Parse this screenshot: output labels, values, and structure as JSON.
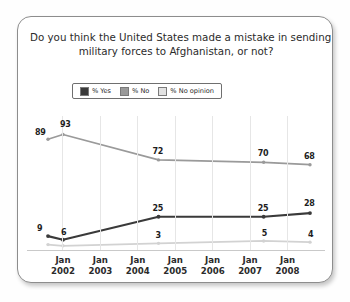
{
  "card": {
    "title_line1": "Do you think the United States made a mistake in sending",
    "title_line2": "military forces to Afghanistan, or not?"
  },
  "chart_data": {
    "type": "line",
    "title": "Do you think the United States made a mistake in sending military forces to Afghanistan, or not?",
    "xlabel": "",
    "ylabel": "",
    "ylim": [
      0,
      100
    ],
    "grid": "vertical",
    "legend_position": "top-center",
    "x_tick_labels": [
      {
        "month": "Jan",
        "year": "2002"
      },
      {
        "month": "Jan",
        "year": "2003"
      },
      {
        "month": "Jan",
        "year": "2004"
      },
      {
        "month": "Jan",
        "year": "2005"
      },
      {
        "month": "Jan",
        "year": "2006"
      },
      {
        "month": "Jan",
        "year": "2007"
      },
      {
        "month": "Jan",
        "year": "2008"
      }
    ],
    "series": [
      {
        "name": "% Yes",
        "color": "#3a3a3a",
        "points": [
          {
            "x": 0.0,
            "y": 9,
            "label": "9"
          },
          {
            "x": 0.42,
            "y": 6,
            "label": "6"
          },
          {
            "x": 3.1,
            "y": 25,
            "label": "25"
          },
          {
            "x": 6.05,
            "y": 25,
            "label": "25"
          },
          {
            "x": 7.35,
            "y": 28,
            "label": "28"
          }
        ]
      },
      {
        "name": "% No",
        "color": "#9a9a9a",
        "points": [
          {
            "x": 0.0,
            "y": 89,
            "label": "89"
          },
          {
            "x": 0.42,
            "y": 93,
            "label": "93"
          },
          {
            "x": 3.1,
            "y": 72,
            "label": "72"
          },
          {
            "x": 6.05,
            "y": 70,
            "label": "70"
          },
          {
            "x": 7.35,
            "y": 68,
            "label": "68"
          }
        ]
      },
      {
        "name": "% No opinion",
        "color": "#d2d2d2",
        "points": [
          {
            "x": 0.0,
            "y": 2,
            "label": ""
          },
          {
            "x": 0.42,
            "y": 1,
            "label": ""
          },
          {
            "x": 3.1,
            "y": 3,
            "label": "3"
          },
          {
            "x": 6.05,
            "y": 5,
            "label": "5"
          },
          {
            "x": 7.35,
            "y": 4,
            "label": "4"
          }
        ]
      }
    ],
    "legend": [
      {
        "label": "% Yes",
        "color": "#3a3a3a"
      },
      {
        "label": "% No",
        "color": "#9a9a9a"
      },
      {
        "label": "% No opinion",
        "color": "#e2e2e2"
      }
    ]
  }
}
